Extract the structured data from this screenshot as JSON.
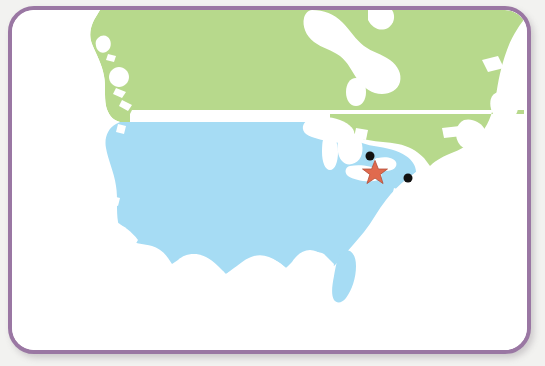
{
  "map": {
    "title": "North America locator map",
    "frame": {
      "border_color": "#9a77a3",
      "border_width_px": 4,
      "corner_radius_px": 26,
      "background_color": "#ffffff",
      "page_background_color": "#f2f2f0",
      "shadow": "soft drop shadow lower-right"
    },
    "regions": [
      {
        "name": "canada",
        "label": "Canada",
        "fill_color": "#b7d98c",
        "description": "Canada landmass shaded light green, spanning the full width north of the 49th parallel, including British Columbia coastal islands, the Hudson Bay white inlet, Quebec, Labrador and the Maritimes."
      },
      {
        "name": "united-states",
        "label": "United States",
        "fill_color": "#a6dcf4",
        "description": "Contiguous United States shaded light blue, from the Pacific Northwest coast east to the Atlantic, including Florida peninsula, Gulf coast and Texas."
      },
      {
        "name": "water-and-outside",
        "label": "Water / outside map area",
        "fill_color": "#ffffff",
        "description": "Oceans, the Great Lakes, Hudson Bay and Mexico rendered as plain white."
      }
    ],
    "markers": [
      {
        "name": "star-marker",
        "type": "star",
        "color": "#e06a4e",
        "outline_color": "#b24c36",
        "x_pct": 70.5,
        "y_pct": 47.6,
        "size_px": 26,
        "note": "Highlighted primary location, Lake Erie region"
      },
      {
        "name": "dot-marker-north",
        "type": "dot",
        "color": "#111111",
        "x_pct": 69.6,
        "y_pct": 42.8,
        "size_px": 9,
        "note": "Secondary location near Detroit / Lake Erie north shore"
      },
      {
        "name": "dot-marker-east",
        "type": "dot",
        "color": "#111111",
        "x_pct": 76.8,
        "y_pct": 49.3,
        "size_px": 9,
        "note": "Secondary location on the northeast Atlantic coast"
      }
    ]
  }
}
